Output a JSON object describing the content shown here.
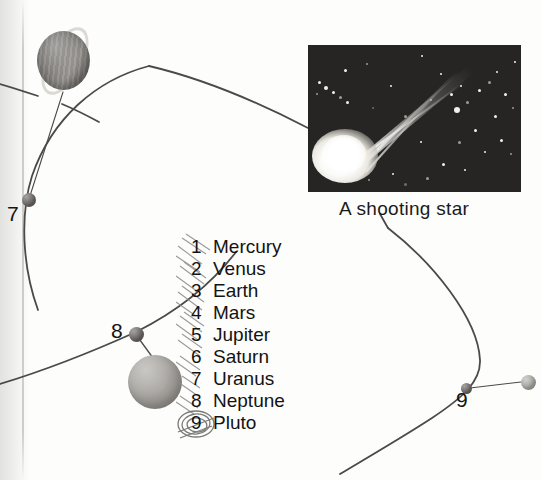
{
  "page": {
    "background_color": "#fdfdfc",
    "width": 541,
    "height": 480
  },
  "photo": {
    "name": "shooting-star-photograph",
    "caption": "A shooting star",
    "background_color": "#262524",
    "subject": "comet-meteor-with-tail",
    "frame": {
      "x": 308,
      "y": 45,
      "width": 213,
      "height": 147
    }
  },
  "key": {
    "title": "Planet key",
    "items": [
      {
        "number": "1",
        "name": "Mercury"
      },
      {
        "number": "2",
        "name": "Venus"
      },
      {
        "number": "3",
        "name": "Earth"
      },
      {
        "number": "4",
        "name": "Mars"
      },
      {
        "number": "5",
        "name": "Jupiter"
      },
      {
        "number": "6",
        "name": "Saturn"
      },
      {
        "number": "7",
        "name": "Uranus"
      },
      {
        "number": "8",
        "name": "Neptune"
      },
      {
        "number": "9",
        "name": "Pluto"
      }
    ]
  },
  "diagram": {
    "labels": [
      {
        "id": "uranus",
        "text": "7",
        "x": 7,
        "y": 205
      },
      {
        "id": "neptune",
        "text": "8",
        "x": 111,
        "y": 320
      },
      {
        "id": "pluto",
        "text": "9",
        "x": 456,
        "y": 392
      }
    ],
    "bodies": [
      {
        "id": "saturn",
        "name": "Saturn",
        "kind": "ringed-planet",
        "color": "#86837f"
      },
      {
        "id": "uranus-marker",
        "name": "Uranus",
        "kind": "orbit-dot",
        "color": "#5e5b58"
      },
      {
        "id": "neptune-marker",
        "name": "Neptune",
        "kind": "orbit-dot",
        "color": "#5e5b58"
      },
      {
        "id": "neptune-globe",
        "name": "Neptune",
        "kind": "planet-globe",
        "color": "#a5a29d"
      },
      {
        "id": "pluto-marker",
        "name": "Pluto",
        "kind": "orbit-dot",
        "color": "#4a4745"
      },
      {
        "id": "pluto-globe",
        "name": "Pluto",
        "kind": "planet-globe",
        "color": "#a8a6a1"
      }
    ],
    "orbit_color": "#4c4a48",
    "orbits": [
      {
        "id": "saturn-orbit",
        "label": "Saturn orbit"
      },
      {
        "id": "uranus-orbit",
        "label": "Uranus orbit"
      },
      {
        "id": "neptune-orbit",
        "label": "Neptune orbit"
      },
      {
        "id": "pluto-orbit",
        "label": "Pluto orbit"
      }
    ]
  },
  "annotations": {
    "medium": "pencil",
    "marks": [
      {
        "id": "scribble-beside-numbers",
        "note": "hatching over numbers 1-8"
      },
      {
        "id": "circle-around-nine",
        "note": "circled 9"
      }
    ]
  }
}
